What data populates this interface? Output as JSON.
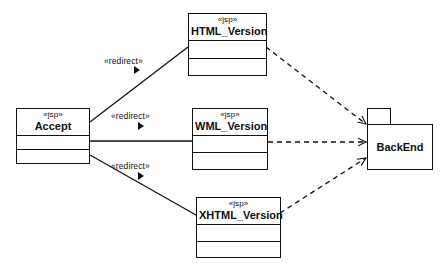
{
  "diagram": {
    "kind": "uml-deployment-diagram",
    "background_color": "#ffffff",
    "line_color": "#111111",
    "text_color": "#111111"
  },
  "nodes": {
    "accept": {
      "id": "accept",
      "stereotype": "«jsp»",
      "name": "Accept",
      "shape": "class",
      "compartments": 3
    },
    "html_version": {
      "id": "html_version",
      "stereotype": "«jsp»",
      "name": "HTML_Version",
      "shape": "class",
      "compartments": 3
    },
    "wml_version": {
      "id": "wml_version",
      "stereotype": "«jsp»",
      "name": "WML_Version",
      "shape": "class",
      "compartments": 3
    },
    "xhtml_version": {
      "id": "xhtml_version",
      "stereotype": "«jsp»",
      "name": "XHTML_Version",
      "shape": "class",
      "compartments": 3
    },
    "backend": {
      "id": "backend",
      "name": "BackEnd",
      "shape": "package"
    }
  },
  "edges": {
    "redirect_html": {
      "label": "«redirect»",
      "from": "accept",
      "to": "html_version",
      "style": "solid",
      "marker": "filled-triangle"
    },
    "redirect_wml": {
      "label": "«redirect»",
      "from": "accept",
      "to": "wml_version",
      "style": "solid",
      "marker": "filled-triangle"
    },
    "redirect_xhtml": {
      "label": "«redirect»",
      "from": "accept",
      "to": "xhtml_version",
      "style": "solid",
      "marker": "filled-triangle"
    },
    "dep_html_backend": {
      "label": "",
      "from": "html_version",
      "to": "backend",
      "style": "dashed",
      "marker": "open-arrow"
    },
    "dep_wml_backend": {
      "label": "",
      "from": "wml_version",
      "to": "backend",
      "style": "dashed",
      "marker": "open-arrow"
    },
    "dep_xhtml_backend": {
      "label": "",
      "from": "xhtml_version",
      "to": "backend",
      "style": "dashed",
      "marker": "open-arrow"
    }
  }
}
